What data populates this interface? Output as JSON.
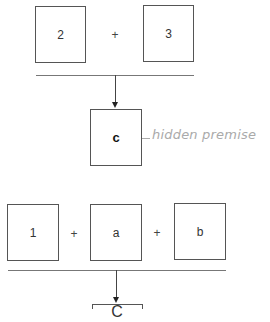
{
  "argument1": {
    "premises": [
      "2",
      "3"
    ],
    "operators": [
      "+"
    ],
    "conclusion": "c",
    "annotation": "hidden premise"
  },
  "argument2": {
    "premises": [
      "1",
      "a",
      "b"
    ],
    "operators": [
      "+",
      "+"
    ],
    "conclusion": "C"
  }
}
